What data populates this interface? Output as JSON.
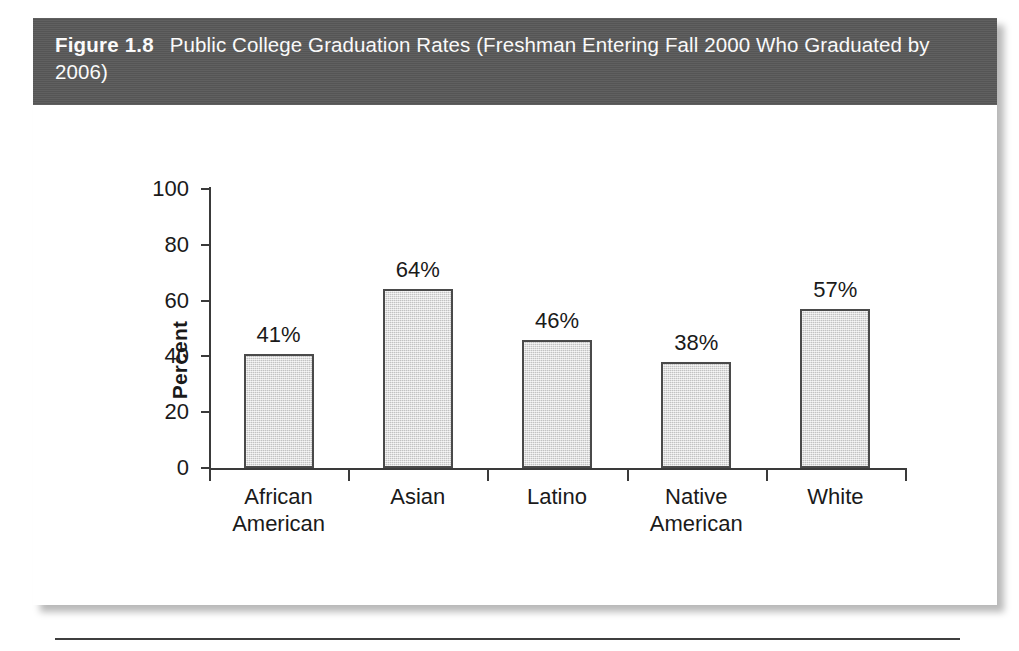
{
  "figure": {
    "number": "Figure 1.8",
    "title": "Public College Graduation Rates (Freshman Entering Fall 2000 Who Graduated by 2006)",
    "header_bg": "#595959",
    "header_text_color": "#ffffff",
    "panel_bg": "#ffffff"
  },
  "chart_data": {
    "type": "bar",
    "title": "Public College Graduation Rates (Freshman Entering Fall 2000 Who Graduated by 2006)",
    "categories": [
      "African American",
      "Asian",
      "Latino",
      "Native American",
      "White"
    ],
    "category_lines": [
      [
        "African",
        "American"
      ],
      [
        "Asian"
      ],
      [
        "Latino"
      ],
      [
        "Native",
        "American"
      ],
      [
        "White"
      ]
    ],
    "values": [
      41,
      64,
      46,
      38,
      57
    ],
    "value_labels": [
      "41%",
      "64%",
      "46%",
      "38%",
      "57%"
    ],
    "xlabel": "",
    "ylabel": "Percent",
    "ylim": [
      0,
      100
    ],
    "yticks": [
      0,
      20,
      40,
      60,
      80,
      100
    ],
    "ytick_labels": [
      "0",
      "20",
      "40",
      "60",
      "80",
      "100"
    ],
    "grid": false,
    "legend": null,
    "bar_fill": "#d9d9d9",
    "bar_border": "#4a4a4a",
    "axis_color": "#3a3a3a"
  }
}
